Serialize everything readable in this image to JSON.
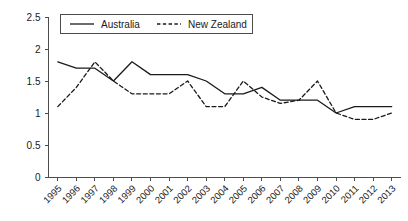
{
  "chart_data": {
    "type": "line",
    "title": "",
    "subtitle": "",
    "xlabel": "",
    "ylabel": "",
    "ylim": [
      0,
      2.5
    ],
    "ytick_labels": [
      "0",
      "0.5",
      "1",
      "1.5",
      "2",
      "2.5"
    ],
    "ytick_values": [
      0,
      0.5,
      1,
      1.5,
      2,
      2.5
    ],
    "grid": false,
    "legend_position": "top-center",
    "categories": [
      "1995",
      "1996",
      "1997",
      "1998",
      "1999",
      "2000",
      "2001",
      "2002",
      "2003",
      "2004",
      "2005",
      "2006",
      "2007",
      "2008",
      "2009",
      "2010",
      "2011",
      "2012",
      "2013"
    ],
    "series": [
      {
        "name": "Australia",
        "style": "solid",
        "color": "#1a1a1a",
        "values": [
          1.8,
          1.7,
          1.7,
          1.5,
          1.8,
          1.6,
          1.6,
          1.6,
          1.5,
          1.3,
          1.3,
          1.4,
          1.2,
          1.2,
          1.2,
          1.0,
          1.1,
          1.1,
          1.1
        ]
      },
      {
        "name": "New Zealand",
        "style": "dashed",
        "color": "#1a1a1a",
        "values": [
          1.1,
          1.4,
          1.8,
          1.5,
          1.3,
          1.3,
          1.3,
          1.5,
          1.1,
          1.1,
          1.5,
          1.25,
          1.15,
          1.2,
          1.5,
          1.0,
          0.9,
          0.9,
          1.0
        ]
      }
    ]
  },
  "legend": {
    "items": [
      {
        "label": "Australia"
      },
      {
        "label": "New Zealand"
      }
    ]
  }
}
